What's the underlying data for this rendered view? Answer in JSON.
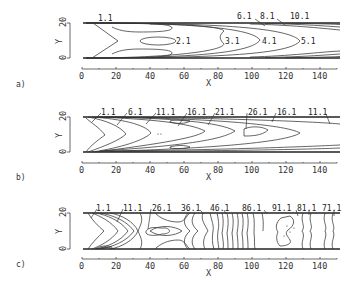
{
  "figure": {
    "panels": [
      {
        "tag": "a)",
        "y_axis": {
          "label": "Y",
          "ticks": [
            "0",
            "20"
          ]
        },
        "x_axis": {
          "label": "X",
          "ticks": [
            "0",
            "20",
            "40",
            "60",
            "80",
            "100",
            "120",
            "140"
          ]
        },
        "contour_labels": [
          "1.1",
          "2.1",
          "3.1",
          "4.1",
          "5.1",
          "6.1",
          "8.1",
          "10.1"
        ]
      },
      {
        "tag": "b)",
        "y_axis": {
          "label": "Y",
          "ticks": [
            "0",
            "20"
          ]
        },
        "x_axis": {
          "label": "X",
          "ticks": [
            "0",
            "20",
            "40",
            "60",
            "80",
            "100",
            "120",
            "140"
          ]
        },
        "contour_labels": [
          "1.1",
          "6.1",
          "11.1",
          "16.1",
          "21.1",
          "26.1",
          "16.1",
          "11.1"
        ]
      },
      {
        "tag": "c)",
        "y_axis": {
          "label": "Y",
          "ticks": [
            "0",
            "20"
          ]
        },
        "x_axis": {
          "label": "X",
          "ticks": [
            "0",
            "20",
            "40",
            "60",
            "80",
            "100",
            "120",
            "140"
          ]
        },
        "contour_labels": [
          "1.1",
          "11.1",
          "26.1",
          "36.1",
          "46.1",
          "86.1",
          "91.1",
          "81.1",
          "71.1"
        ]
      }
    ]
  }
}
